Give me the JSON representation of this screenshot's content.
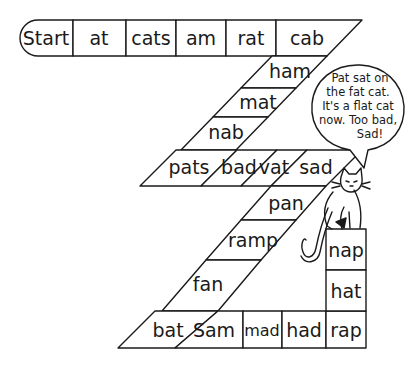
{
  "ink_color": "#1a1a1a",
  "paper_color": "#ffffff",
  "path": {
    "top_row": [
      "Start",
      "at",
      "cats",
      "am",
      "rat",
      "cab"
    ],
    "upper_diagonal": [
      "ham",
      "mat",
      "nab"
    ],
    "middle_row": [
      "pats",
      "bad",
      "vat",
      "sad"
    ],
    "lower_diagonal": [
      "pan",
      "ramp",
      "fan"
    ],
    "bottom_row": [
      "bat",
      "Sam",
      "mad",
      "had",
      "rap"
    ],
    "right_column": [
      "nap",
      "hat"
    ]
  },
  "speech_bubble": {
    "lines": [
      "Pat sat on",
      "the fat cat.",
      "It's a flat cat",
      "now. Too bad,",
      "Sad!"
    ]
  },
  "illustration": {
    "character": "cat",
    "sitting_on": "nap"
  }
}
